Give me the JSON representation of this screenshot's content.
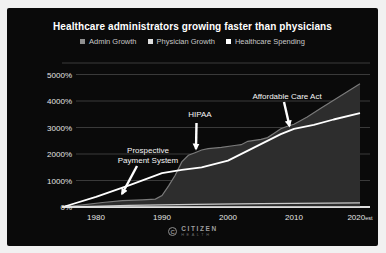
{
  "title": "Healthcare administrators growing faster than physicians",
  "legend": [
    {
      "label": "Admin Growth",
      "color": "#8f8f8f"
    },
    {
      "label": "Physician Growth",
      "color": "#dedede"
    },
    {
      "label": "Healthcare Spending",
      "color": "#ffffff"
    }
  ],
  "footer": {
    "brand": "CITIZEN",
    "brand_sub": "HEALTH",
    "icon": "citizen-health-logo",
    "icon_glyph": "C"
  },
  "chart_data": {
    "type": "area",
    "title": "Healthcare administrators growing faster than physicians",
    "xlabel": "",
    "ylabel": "",
    "grid": true,
    "legend_position": "top",
    "xlim": [
      1975,
      2020
    ],
    "ylim": [
      0,
      5400
    ],
    "y_ticks": [
      {
        "label": "0%",
        "value": 0
      },
      {
        "label": "1000%",
        "value": 1000
      },
      {
        "label": "2000%",
        "value": 2000
      },
      {
        "label": "3000%",
        "value": 3000
      },
      {
        "label": "4000%",
        "value": 4000
      },
      {
        "label": "5000%",
        "value": 5000
      }
    ],
    "x_ticks": [
      {
        "label": "1980",
        "year": 1980
      },
      {
        "label": "1990",
        "year": 1990
      },
      {
        "label": "2000",
        "year": 2000
      },
      {
        "label": "2010",
        "year": 2010
      },
      {
        "label": "2020",
        "year": 2020,
        "suffix": "est"
      }
    ],
    "series": [
      {
        "name": "Admin Growth",
        "kind": "area",
        "stroke": "#7a7a7a",
        "fill": "#2d2d2d",
        "stroke_width": 1.2,
        "points": [
          [
            1975,
            0
          ],
          [
            1978,
            80
          ],
          [
            1981,
            170
          ],
          [
            1984,
            240
          ],
          [
            1987,
            270
          ],
          [
            1989,
            300
          ],
          [
            1990,
            430
          ],
          [
            1991,
            800
          ],
          [
            1992,
            1200
          ],
          [
            1993,
            1700
          ],
          [
            1994,
            1950
          ],
          [
            1995,
            2050
          ],
          [
            1996,
            2150
          ],
          [
            1997,
            2200
          ],
          [
            1999,
            2250
          ],
          [
            2001,
            2320
          ],
          [
            2002,
            2350
          ],
          [
            2003,
            2480
          ],
          [
            2005,
            2550
          ],
          [
            2006,
            2620
          ],
          [
            2007,
            2780
          ],
          [
            2008,
            2950
          ],
          [
            2009,
            3050
          ],
          [
            2010,
            3120
          ],
          [
            2012,
            3400
          ],
          [
            2014,
            3720
          ],
          [
            2016,
            4030
          ],
          [
            2018,
            4340
          ],
          [
            2020,
            4650
          ]
        ]
      },
      {
        "name": "Healthcare Spending",
        "kind": "line",
        "stroke": "#ffffff",
        "stroke_width": 1.8,
        "points": [
          [
            1975,
            0
          ],
          [
            1980,
            380
          ],
          [
            1985,
            820
          ],
          [
            1990,
            1280
          ],
          [
            1993,
            1400
          ],
          [
            1996,
            1500
          ],
          [
            2000,
            1750
          ],
          [
            2004,
            2250
          ],
          [
            2008,
            2750
          ],
          [
            2010,
            2950
          ],
          [
            2013,
            3100
          ],
          [
            2016,
            3300
          ],
          [
            2020,
            3540
          ]
        ]
      },
      {
        "name": "Physician Growth",
        "kind": "line",
        "stroke": "#c9c9c9",
        "stroke_width": 1.2,
        "points": [
          [
            1975,
            0
          ],
          [
            1985,
            60
          ],
          [
            1995,
            100
          ],
          [
            2005,
            130
          ],
          [
            2020,
            160
          ]
        ]
      }
    ],
    "annotations": [
      {
        "text": [
          "Prospective",
          "Payment System"
        ],
        "label_x": 148,
        "label_y": 153,
        "tail": [
          137,
          166
        ],
        "tip": [
          122,
          194
        ]
      },
      {
        "text": [
          "HIPAA"
        ],
        "label_x": 200,
        "label_y": 117,
        "tail": [
          196.5,
          123
        ],
        "tip": [
          196,
          149
        ]
      },
      {
        "text": [
          "Affordable Care Act"
        ],
        "label_x": 287,
        "label_y": 99,
        "tail": [
          284,
          102
        ],
        "tip": [
          289.5,
          126
        ]
      }
    ]
  }
}
